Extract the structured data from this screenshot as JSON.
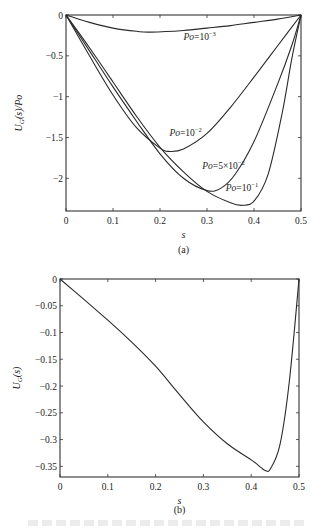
{
  "chart_data": [
    {
      "type": "line",
      "panel": "(a)",
      "title": "",
      "xlabel": "s",
      "ylabel": "U_G(s)/Po",
      "xlim": [
        0,
        0.5
      ],
      "ylim": [
        -2.4,
        0
      ],
      "xticks": [
        0,
        0.1,
        0.2,
        0.3,
        0.4,
        0.5
      ],
      "xtick_labels": [
        "0",
        "0.1",
        "0.2",
        "0.3",
        "0.4",
        "0.5"
      ],
      "yticks": [
        0,
        -0.5,
        -1,
        -1.5,
        -2
      ],
      "ytick_labels": [
        "0",
        "-0.5",
        "-1",
        "-1.5",
        "-2"
      ],
      "grid": false,
      "legend": "inline labels",
      "series": [
        {
          "name": "Po=10^-3",
          "label_base": "Po=10",
          "label_exp": "-3",
          "x": [
            0,
            0.05,
            0.1,
            0.15,
            0.18,
            0.25,
            0.3,
            0.35,
            0.4,
            0.45,
            0.5
          ],
          "y": [
            0,
            -0.09,
            -0.16,
            -0.2,
            -0.21,
            -0.19,
            -0.16,
            -0.13,
            -0.09,
            -0.05,
            0
          ]
        },
        {
          "name": "Po=10^-2",
          "label_base": "Po=10",
          "label_exp": "-2",
          "x": [
            0,
            0.05,
            0.1,
            0.15,
            0.2,
            0.22,
            0.25,
            0.3,
            0.35,
            0.4,
            0.45,
            0.5
          ],
          "y": [
            0,
            -0.5,
            -0.98,
            -1.38,
            -1.63,
            -1.67,
            -1.64,
            -1.45,
            -1.13,
            -0.76,
            -0.38,
            0
          ]
        },
        {
          "name": "Po=5x10^-2",
          "label_base": "Po=5×10",
          "label_exp": "-2",
          "x": [
            0,
            0.05,
            0.1,
            0.15,
            0.2,
            0.25,
            0.3,
            0.33,
            0.36,
            0.4,
            0.45,
            0.48,
            0.5
          ],
          "y": [
            0,
            -0.44,
            -0.88,
            -1.3,
            -1.7,
            -2.0,
            -2.15,
            -2.12,
            -1.95,
            -1.55,
            -0.85,
            -0.38,
            0
          ]
        },
        {
          "name": "Po=10^-1",
          "label_base": "Po=10",
          "label_exp": "-1",
          "x": [
            0,
            0.05,
            0.1,
            0.15,
            0.2,
            0.25,
            0.3,
            0.35,
            0.375,
            0.4,
            0.43,
            0.46,
            0.48,
            0.5
          ],
          "y": [
            0,
            -0.4,
            -0.82,
            -1.24,
            -1.62,
            -1.92,
            -2.16,
            -2.3,
            -2.33,
            -2.28,
            -1.95,
            -1.2,
            -0.55,
            0
          ]
        }
      ],
      "annotations": [
        {
          "text": "Po=10^-3",
          "x": 0.25,
          "y": -0.3
        },
        {
          "text": "Po=10^-2",
          "x": 0.22,
          "y": -1.48
        },
        {
          "text": "Po=5x10^-2",
          "x": 0.29,
          "y": -1.88
        },
        {
          "text": "Po=10^-1",
          "x": 0.34,
          "y": -2.15
        }
      ]
    },
    {
      "type": "line",
      "panel": "(b)",
      "title": "",
      "xlabel": "s",
      "ylabel": "U_G(s)",
      "xlim": [
        0,
        0.5
      ],
      "ylim": [
        -0.37,
        0
      ],
      "xticks": [
        0,
        0.1,
        0.2,
        0.3,
        0.4,
        0.5
      ],
      "xtick_labels": [
        "0",
        "0.1",
        "0.2",
        "0.3",
        "0.4",
        "0.5"
      ],
      "yticks": [
        0,
        -0.05,
        -0.1,
        -0.15,
        -0.2,
        -0.25,
        -0.3,
        -0.35
      ],
      "ytick_labels": [
        "0",
        "-0.05",
        "-0.1",
        "-0.15",
        "-0.2",
        "-0.25",
        "-0.3",
        "-0.35"
      ],
      "grid": false,
      "series": [
        {
          "name": "U_G(s)",
          "x": [
            0,
            0.05,
            0.1,
            0.15,
            0.2,
            0.25,
            0.3,
            0.35,
            0.4,
            0.42,
            0.43,
            0.44,
            0.46,
            0.48,
            0.5
          ],
          "y": [
            0,
            -0.038,
            -0.077,
            -0.118,
            -0.163,
            -0.216,
            -0.267,
            -0.308,
            -0.338,
            -0.352,
            -0.358,
            -0.355,
            -0.31,
            -0.19,
            0
          ]
        }
      ]
    }
  ],
  "panels": {
    "a": {
      "caption": "(a)",
      "xlabel": "s",
      "ylabel": "U_G(s)/Po"
    },
    "b": {
      "caption": "(b)",
      "xlabel": "s",
      "ylabel": "U_G(s)"
    }
  },
  "style": {
    "line_color": "#2a2a2a",
    "axis_color": "#333333",
    "background": "#ffffff"
  }
}
